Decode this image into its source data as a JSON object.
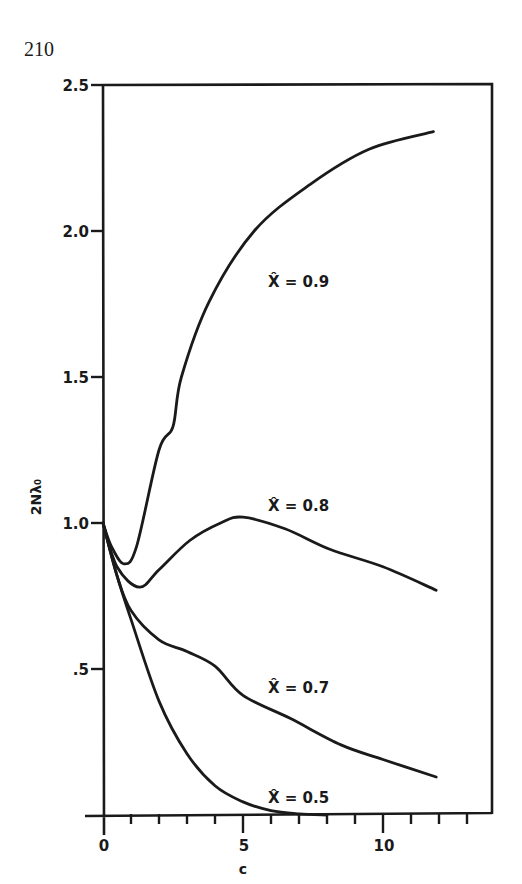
{
  "page": {
    "number": "210"
  },
  "chart_data": {
    "type": "line",
    "title": "",
    "xlabel": "c",
    "ylabel": "2Nλ₀",
    "xlim": [
      0,
      14
    ],
    "ylim": [
      0,
      2.5
    ],
    "grid": false,
    "legend": "inline labels",
    "x_ticks": {
      "major": [
        0,
        5,
        10
      ],
      "major_labels": [
        "0",
        "5",
        "10"
      ],
      "minor_step": 1
    },
    "y_ticks": {
      "values": [
        0.5,
        1.0,
        1.5,
        2.0,
        2.5
      ],
      "labels": [
        ".5",
        "1.0",
        "1.5",
        "2.0",
        "2.5"
      ]
    },
    "series": [
      {
        "name": "X̂ = 0.9",
        "label": "X̂ = 0.9",
        "x": [
          0,
          0.3,
          0.75,
          1.2,
          2.0,
          2.5,
          2.8,
          3.8,
          5.4,
          7.4,
          9.5,
          11.8
        ],
        "y": [
          1.0,
          0.92,
          0.86,
          0.92,
          1.25,
          1.33,
          1.5,
          1.76,
          2.0,
          2.16,
          2.28,
          2.34
        ]
      },
      {
        "name": "X̂ = 0.8",
        "label": "X̂ = 0.8",
        "x": [
          0,
          0.5,
          1.3,
          2.0,
          3.1,
          4.2,
          5.0,
          6.5,
          8.1,
          10.0,
          11.9
        ],
        "y": [
          1.0,
          0.85,
          0.78,
          0.84,
          0.94,
          1.0,
          1.02,
          0.98,
          0.91,
          0.85,
          0.77
        ]
      },
      {
        "name": "X̂ = 0.7",
        "label": "X̂ = 0.7",
        "x": [
          0,
          0.5,
          1.0,
          2.0,
          3.0,
          4.0,
          5.0,
          6.7,
          8.5,
          10.0,
          11.9
        ],
        "y": [
          1.0,
          0.82,
          0.7,
          0.6,
          0.56,
          0.51,
          0.41,
          0.33,
          0.24,
          0.19,
          0.13
        ]
      },
      {
        "name": "X̂ = 0.5",
        "label": "X̂ = 0.5",
        "x": [
          0,
          0.5,
          1.0,
          2.0,
          3.0,
          4.0,
          5.0,
          6.0,
          7.0,
          8.0
        ],
        "y": [
          1.0,
          0.82,
          0.67,
          0.39,
          0.21,
          0.1,
          0.045,
          0.015,
          0.004,
          0.0
        ]
      }
    ],
    "annotations": [
      {
        "text": "X̂ = 0.9",
        "at_x": 6.0,
        "at_y": 1.83
      },
      {
        "text": "X̂ = 0.8",
        "at_x": 6.0,
        "at_y": 1.06
      },
      {
        "text": "X̂ = 0.7",
        "at_x": 6.0,
        "at_y": 0.44
      },
      {
        "text": "X̂ = 0.5",
        "at_x": 6.0,
        "at_y": 0.06
      }
    ]
  }
}
